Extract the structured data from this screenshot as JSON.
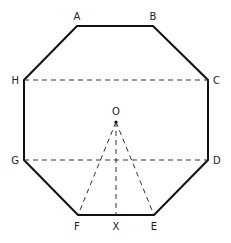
{
  "diagram": {
    "colors": {
      "stroke": "#111111",
      "dashed": "#333333",
      "label": "#222222"
    },
    "vertices": [
      {
        "id": "A",
        "x": 77,
        "y": 26,
        "label": "A"
      },
      {
        "id": "B",
        "x": 153,
        "y": 26,
        "label": "B"
      },
      {
        "id": "C",
        "x": 208,
        "y": 80,
        "label": "C"
      },
      {
        "id": "D",
        "x": 208,
        "y": 160,
        "label": "D"
      },
      {
        "id": "E",
        "x": 154,
        "y": 215,
        "label": "E"
      },
      {
        "id": "F",
        "x": 78,
        "y": 215,
        "label": "F"
      },
      {
        "id": "G",
        "x": 24,
        "y": 160,
        "label": "G"
      },
      {
        "id": "H",
        "x": 24,
        "y": 80,
        "label": "H"
      }
    ],
    "points": [
      {
        "id": "O",
        "x": 116,
        "y": 122,
        "label": "O"
      },
      {
        "id": "X",
        "x": 116,
        "y": 215,
        "label": "X"
      }
    ],
    "solid_segments": [
      "AB",
      "BC",
      "CD",
      "DE",
      "EF",
      "FG",
      "GH",
      "HA"
    ],
    "dashed_segments": [
      "HC",
      "GD",
      "OF",
      "OX",
      "OE"
    ],
    "labels": {
      "A": "A",
      "B": "B",
      "C": "C",
      "D": "D",
      "E": "E",
      "F": "F",
      "G": "G",
      "H": "H",
      "O": "O",
      "X": "X"
    }
  }
}
